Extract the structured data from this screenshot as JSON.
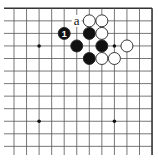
{
  "diagram": {
    "type": "go-board-fragment",
    "corner": "top-right",
    "grid": {
      "origin_x": 14,
      "origin_y": 8.3,
      "spacing": 12.55,
      "cols": 12,
      "rows": 12,
      "h_line_start_x": 4,
      "v_line_end_y": 155,
      "line_color": "#555555",
      "edge_color": "#333333"
    },
    "star_points": [
      {
        "col": 2,
        "row": 3
      },
      {
        "col": 8,
        "row": 3
      },
      {
        "col": 2,
        "row": 9
      },
      {
        "col": 8,
        "row": 9
      }
    ],
    "stones": [
      {
        "color": "white",
        "col": 6,
        "row": 1
      },
      {
        "color": "white",
        "col": 7,
        "row": 1
      },
      {
        "color": "black",
        "col": 4,
        "row": 2,
        "label": "1"
      },
      {
        "color": "black",
        "col": 6,
        "row": 2
      },
      {
        "color": "white",
        "col": 7,
        "row": 2
      },
      {
        "color": "black",
        "col": 5,
        "row": 3
      },
      {
        "color": "black",
        "col": 7,
        "row": 3
      },
      {
        "color": "white",
        "col": 9,
        "row": 3
      },
      {
        "color": "black",
        "col": 6,
        "row": 4
      },
      {
        "color": "white",
        "col": 7,
        "row": 4
      },
      {
        "color": "white",
        "col": 8,
        "row": 4
      }
    ],
    "marks": [
      {
        "label": "a",
        "col": 5,
        "row": 1
      }
    ],
    "colors": {
      "black_stone": "#111111",
      "white_stone": "#ffffff",
      "stone_outline": "#222222",
      "background": "#ffffff"
    }
  }
}
